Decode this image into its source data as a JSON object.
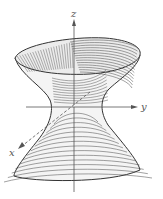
{
  "figure": {
    "title": "",
    "surface": "hyperboloid of one sheet",
    "axes": {
      "z_label": "z",
      "y_label": "y",
      "x_label": "x"
    },
    "colors": {
      "background": "#ffffff",
      "line": "#444444",
      "axis": "#555555",
      "fill_front": "#f4f4f4",
      "fill_inner": "#ececec"
    },
    "contour_count_top": 14,
    "contour_count_bottom": 14
  }
}
